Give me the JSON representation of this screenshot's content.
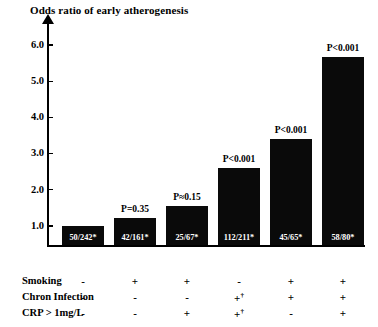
{
  "chart_data": {
    "type": "bar",
    "title": "Odds ratio of early atherogenesis",
    "xlabel": "",
    "ylabel": "Odds ratio of early atherogenesis",
    "ylim": [
      0,
      6.4
    ],
    "yticks": [
      1.0,
      2.0,
      3.0,
      4.0,
      5.0,
      6.0
    ],
    "ytick_labels": [
      "1.0",
      "2.0",
      "3.0",
      "4.0",
      "5.0",
      "6.0"
    ],
    "grid": false,
    "legend": "none",
    "bar_color": "#0a0a0a",
    "categories": [
      "1",
      "2",
      "3",
      "4",
      "5",
      "6"
    ],
    "values": [
      1.0,
      1.22,
      1.55,
      2.6,
      3.4,
      5.65
    ],
    "point_labels": [
      "50/242*",
      "42/161*",
      "25/67*",
      "112/211*",
      "45/65*",
      "58/80*"
    ],
    "annotations": [
      "",
      "P=0.35",
      "P≈0.15",
      "P<0.001",
      "P<0.001",
      "P<0.001"
    ]
  },
  "table": {
    "rows": [
      {
        "label": "Smoking",
        "cells": [
          {
            "sign": "-",
            "dagger": ""
          },
          {
            "sign": "+",
            "dagger": ""
          },
          {
            "sign": "+",
            "dagger": ""
          },
          {
            "sign": "-",
            "dagger": ""
          },
          {
            "sign": "+",
            "dagger": ""
          },
          {
            "sign": "+",
            "dagger": ""
          }
        ]
      },
      {
        "label": "Chron Infection",
        "cells": [
          {
            "sign": "-",
            "dagger": ""
          },
          {
            "sign": "-",
            "dagger": ""
          },
          {
            "sign": "-",
            "dagger": ""
          },
          {
            "sign": "+",
            "dagger": "†"
          },
          {
            "sign": "+",
            "dagger": ""
          },
          {
            "sign": "+",
            "dagger": ""
          }
        ]
      },
      {
        "label": "CRP > 1mg/L",
        "cells": [
          {
            "sign": "-",
            "dagger": ""
          },
          {
            "sign": "-",
            "dagger": ""
          },
          {
            "sign": "+",
            "dagger": ""
          },
          {
            "sign": "+",
            "dagger": "†"
          },
          {
            "sign": "-",
            "dagger": ""
          },
          {
            "sign": "+",
            "dagger": ""
          }
        ]
      }
    ]
  }
}
